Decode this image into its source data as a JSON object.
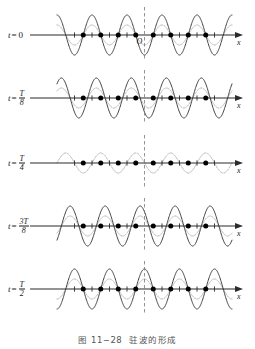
{
  "figure": {
    "caption_number": "图 11−28",
    "caption_text": "驻波的形成",
    "origin_label": "O",
    "axis_label_x": "x",
    "axis_label_t": "t",
    "equals": "=",
    "colors": {
      "resultant": "#3a3a3a",
      "wave_right": "#a8a8a8",
      "wave_left": "#c4c4c4",
      "axis": "#2b2b2b",
      "node_dot": "#000000",
      "antinode_tick": "#2b2b2b",
      "center_line": "#7a7a7a",
      "background": "#ffffff",
      "caption": "#555555"
    }
  },
  "chart_data": {
    "type": "line",
    "title": "驻波的形成",
    "xlabel": "x",
    "ylabel": "",
    "grid": false,
    "legend": false,
    "x_range": [
      -2.5,
      2.5
    ],
    "x_units": "wavelengths",
    "amplitude_component": 1,
    "amplitude_resultant": 2,
    "node_positions": [
      -1.75,
      -1.25,
      -0.75,
      -0.25,
      0.25,
      0.75,
      1.25,
      1.75
    ],
    "antinode_positions": [
      -2.0,
      -1.5,
      -1.0,
      -0.5,
      0.0,
      0.5,
      1.0,
      1.5,
      2.0
    ],
    "panels": [
      {
        "time_label": "0",
        "time_numerator": "",
        "time_denominator": "",
        "is_fraction": false,
        "phase_right_deg": 0,
        "phase_left_deg": 0,
        "resultant_amplitude": 2,
        "resultant_flat": false,
        "note": "Waves in phase; resultant at maximum negative displacement at x=0."
      },
      {
        "time_label": "T/8",
        "time_numerator": "T",
        "time_denominator": "8",
        "is_fraction": true,
        "phase_right_deg": 45,
        "phase_left_deg": -45,
        "resultant_amplitude": 1.414,
        "resultant_flat": false,
        "note": "Waves shifted by ±45°; resultant amplitude reduced to 0.707 of maximum."
      },
      {
        "time_label": "T/4",
        "time_numerator": "T",
        "time_denominator": "4",
        "is_fraction": true,
        "phase_right_deg": 90,
        "phase_left_deg": -90,
        "resultant_amplitude": 0,
        "resultant_flat": true,
        "note": "Waves exactly out of phase; resultant is zero everywhere (straight line)."
      },
      {
        "time_label": "3T/8",
        "time_numerator": "3T",
        "time_denominator": "8",
        "is_fraction": true,
        "phase_right_deg": 135,
        "phase_left_deg": -135,
        "resultant_amplitude": 1.414,
        "resultant_flat": false,
        "note": "Resultant grows again but with opposite sign to t=T/8."
      },
      {
        "time_label": "T/2",
        "time_numerator": "T",
        "time_denominator": "2",
        "is_fraction": true,
        "phase_right_deg": 180,
        "phase_left_deg": 180,
        "resultant_amplitude": 2,
        "resultant_flat": false,
        "note": "Waves in phase again; resultant at maximum positive displacement at x=0, inverse of t=0."
      }
    ]
  }
}
